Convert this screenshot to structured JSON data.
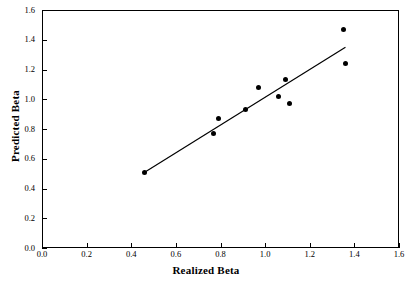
{
  "chart_data": {
    "type": "scatter",
    "title": "",
    "xlabel": "Realized Beta",
    "ylabel": "Predicted Beta",
    "xlim": [
      0.0,
      1.6
    ],
    "ylim": [
      0.0,
      1.6
    ],
    "xticks": [
      "0.0",
      "0.2",
      "0.4",
      "0.6",
      "0.8",
      "1.0",
      "1.2",
      "1.4",
      "1.6"
    ],
    "yticks": [
      "0.0",
      "0.2",
      "0.4",
      "0.6",
      "0.8",
      "1.0",
      "1.2",
      "1.4",
      "1.6"
    ],
    "xtick_values": [
      0.0,
      0.2,
      0.4,
      0.6,
      0.8,
      1.0,
      1.2,
      1.4,
      1.6
    ],
    "ytick_values": [
      0.0,
      0.2,
      0.4,
      0.6,
      0.8,
      1.0,
      1.2,
      1.4,
      1.6
    ],
    "grid": false,
    "legend": null,
    "marker": "filled-circle",
    "marker_color": "#000000",
    "line_color": "#000000",
    "frame_color": "#000000",
    "background": "#ffffff",
    "points": [
      {
        "x": 0.46,
        "y": 0.51
      },
      {
        "x": 0.77,
        "y": 0.77
      },
      {
        "x": 0.79,
        "y": 0.87
      },
      {
        "x": 0.91,
        "y": 0.93
      },
      {
        "x": 0.97,
        "y": 1.08
      },
      {
        "x": 1.06,
        "y": 1.02
      },
      {
        "x": 1.09,
        "y": 1.13
      },
      {
        "x": 1.11,
        "y": 0.97
      },
      {
        "x": 1.35,
        "y": 1.47
      },
      {
        "x": 1.36,
        "y": 1.24
      }
    ],
    "series": [
      {
        "name": "observations",
        "x": [
          0.46,
          0.77,
          0.79,
          0.91,
          0.97,
          1.06,
          1.09,
          1.11,
          1.35,
          1.36
        ],
        "values": [
          0.51,
          0.77,
          0.87,
          0.93,
          1.08,
          1.02,
          1.13,
          0.97,
          1.47,
          1.24
        ]
      },
      {
        "name": "fit-line",
        "type": "line",
        "x": [
          0.46,
          1.36
        ],
        "values": [
          0.51,
          1.35
        ]
      }
    ],
    "fit_line": {
      "x0": 0.46,
      "y0": 0.51,
      "x1": 1.36,
      "y1": 1.35
    }
  }
}
